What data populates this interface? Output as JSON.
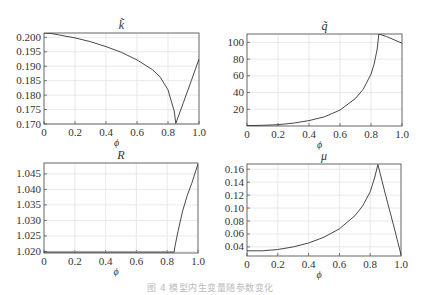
{
  "figure": {
    "caption": "图 4  模型内生变量随参数变化"
  },
  "chart_data": [
    {
      "id": "k_tilde",
      "type": "line",
      "title": "k̃",
      "xlabel": "ϕ",
      "ylabel": "",
      "xlim": [
        0,
        1.0
      ],
      "ylim": [
        0.17,
        0.2015
      ],
      "xticks": [
        "0",
        "0.2",
        "0.4",
        "0.6",
        "0.8",
        "1.0"
      ],
      "yticks": [
        "0.170",
        "0.175",
        "0.180",
        "0.185",
        "0.190",
        "0.195",
        "0.200"
      ],
      "grid": true,
      "x": [
        0,
        0.05,
        0.1,
        0.2,
        0.3,
        0.4,
        0.5,
        0.6,
        0.7,
        0.75,
        0.8,
        0.84,
        0.85,
        0.9,
        0.95,
        1.0
      ],
      "values": [
        0.2015,
        0.2013,
        0.2008,
        0.1998,
        0.1985,
        0.1968,
        0.1948,
        0.1922,
        0.1888,
        0.1862,
        0.1818,
        0.1745,
        0.1702,
        0.1775,
        0.185,
        0.1925
      ]
    },
    {
      "id": "q_tilde",
      "type": "line",
      "title": "q̃",
      "xlabel": "ϕ",
      "ylabel": "",
      "xlim": [
        0,
        1.0
      ],
      "ylim": [
        0,
        110
      ],
      "xticks": [
        "0",
        "0.2",
        "0.4",
        "0.6",
        "0.8",
        "1.0"
      ],
      "yticks": [
        "20",
        "40",
        "60",
        "80",
        "100"
      ],
      "grid": true,
      "x": [
        0,
        0.1,
        0.2,
        0.3,
        0.4,
        0.5,
        0.6,
        0.7,
        0.75,
        0.8,
        0.82,
        0.84,
        0.85,
        0.9,
        0.95,
        1.0
      ],
      "values": [
        0.5,
        0.8,
        1.5,
        3.5,
        6.5,
        11,
        19,
        33,
        44,
        62,
        74,
        92,
        110,
        107,
        103,
        99
      ]
    },
    {
      "id": "R",
      "type": "line",
      "title": "R",
      "xlabel": "ϕ",
      "ylabel": "",
      "xlim": [
        0,
        1.0
      ],
      "ylim": [
        1.0195,
        1.0485
      ],
      "xticks": [
        "0",
        "0.2",
        "0.4",
        "0.6",
        "0.8",
        "1.0"
      ],
      "yticks": [
        "1.020",
        "1.025",
        "1.030",
        "1.035",
        "1.040",
        "1.045"
      ],
      "grid": true,
      "x": [
        0,
        0.2,
        0.4,
        0.6,
        0.8,
        0.845,
        0.85,
        0.87,
        0.9,
        0.93,
        0.96,
        1.0
      ],
      "values": [
        1.0198,
        1.0198,
        1.0198,
        1.0198,
        1.0198,
        1.0198,
        1.0215,
        1.0265,
        1.033,
        1.038,
        1.042,
        1.0482
      ]
    },
    {
      "id": "mu",
      "type": "line",
      "title": "μ",
      "xlabel": "ϕ",
      "ylabel": "",
      "xlim": [
        0,
        1.0
      ],
      "ylim": [
        0.026,
        0.168
      ],
      "xticks": [
        "0",
        "0.2",
        "0.4",
        "0.6",
        "0.8",
        "1.0"
      ],
      "yticks": [
        "0.04",
        "0.06",
        "0.08",
        "0.10",
        "0.12",
        "0.14",
        "0.16"
      ],
      "grid": true,
      "x": [
        0,
        0.1,
        0.2,
        0.3,
        0.4,
        0.5,
        0.6,
        0.7,
        0.75,
        0.8,
        0.83,
        0.85,
        0.9,
        0.95,
        1.0
      ],
      "values": [
        0.034,
        0.034,
        0.036,
        0.04,
        0.046,
        0.055,
        0.068,
        0.088,
        0.103,
        0.125,
        0.148,
        0.167,
        0.12,
        0.075,
        0.028
      ]
    }
  ]
}
